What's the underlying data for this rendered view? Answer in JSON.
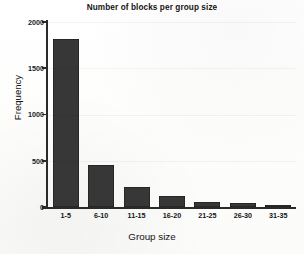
{
  "chart_data": {
    "type": "bar",
    "title": "Number of blocks per group size",
    "xlabel": "Group size",
    "ylabel": "Frequency",
    "categories": [
      "1-5",
      "6-10",
      "11-15",
      "16-20",
      "21-25",
      "26-30",
      "31-35"
    ],
    "values": [
      1820,
      450,
      220,
      120,
      55,
      42,
      20
    ],
    "ylim": [
      0,
      2000
    ],
    "yticks": [
      0,
      500,
      1000,
      1500,
      2000
    ],
    "ytick_labels": [
      "0",
      "500",
      "1000",
      "1500",
      "2000"
    ],
    "grid": false,
    "legend": null,
    "bar_color": "#373737",
    "background_color": "#ffffff",
    "axis_color": "#2a2a2a"
  }
}
